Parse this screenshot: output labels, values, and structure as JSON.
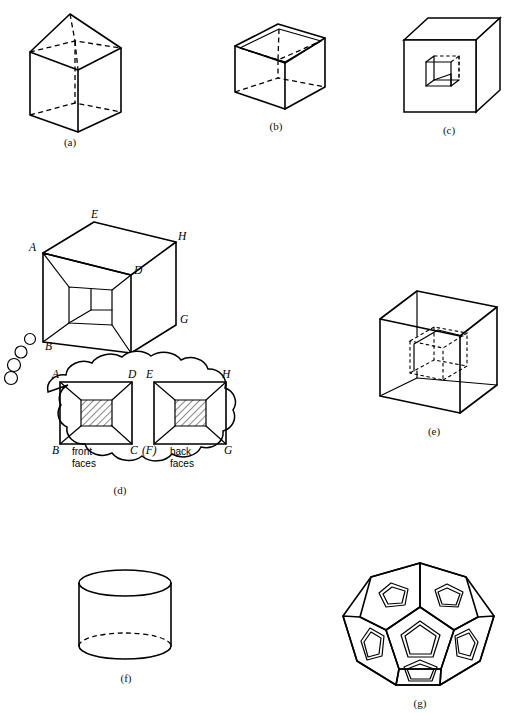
{
  "page": {
    "background": "#ffffff",
    "ink": "#000000",
    "width": 518,
    "height": 713
  },
  "figures": [
    {
      "id": "a",
      "caption": "(a)",
      "name": "cube-with-pyramid-top",
      "description": "Transparent cube surmounted by a square pyramid; hidden edges dashed"
    },
    {
      "id": "b",
      "caption": "(b)",
      "name": "open-box-with-pyramidal-cavity",
      "description": "Open-topped cube with an inverted pyramidal cavity inside; hidden edges dashed"
    },
    {
      "id": "c",
      "caption": "(c)",
      "name": "solid-cube-with-square-recess",
      "description": "Opaque cube with a small cubical recess cut into the front face; hidden edges dashed"
    },
    {
      "id": "d",
      "caption": "(d)",
      "name": "labelled-cube-with-square-cavity-and-thought-bubble",
      "description": "Cube with a deep square cavity, vertices lettered, plus a thought bubble containing the front-face and back-face square diagrams"
    },
    {
      "id": "e",
      "caption": "(e)",
      "name": "wireframe-cube-with-inner-cube",
      "description": "Transparent wireframe cube containing a smaller dashed cube"
    },
    {
      "id": "f",
      "caption": "(f)",
      "name": "cylinder",
      "description": "Upright cylinder with hidden rear half of the base ellipse dashed"
    },
    {
      "id": "g",
      "caption": "(g)",
      "name": "dodecahedron-with-pentagon-insets",
      "description": "Dodecahedron whose visible pentagonal faces each carry a small shaded pentagon inset"
    }
  ],
  "figure_d": {
    "cube_vertex_labels": [
      {
        "label": "E",
        "position": "top-back"
      },
      {
        "label": "A",
        "position": "top-left-front"
      },
      {
        "label": "H",
        "position": "top-right-back"
      },
      {
        "label": "D",
        "position": "cavity-top-right"
      },
      {
        "label": "B",
        "position": "bottom-left-front"
      },
      {
        "label": "G",
        "position": "bottom-right-back"
      },
      {
        "label": "C",
        "position": "bottom-right-front"
      }
    ],
    "thought_bubble": {
      "left_square": {
        "corner_labels": [
          "A",
          "D",
          "B",
          "C"
        ],
        "caption_line1": "front",
        "caption_line2": "faces"
      },
      "right_square": {
        "corner_labels": [
          "E",
          "H",
          "(F)",
          "G"
        ],
        "caption_line1": "back",
        "caption_line2": "faces"
      }
    }
  }
}
